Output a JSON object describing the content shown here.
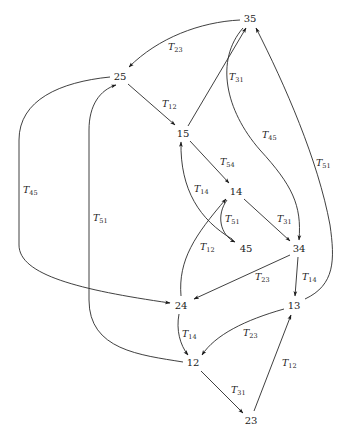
{
  "diagram": {
    "type": "directed-graph",
    "nodes": [
      {
        "id": "35",
        "label": "35",
        "x": 250,
        "y": 19
      },
      {
        "id": "25",
        "label": "25",
        "x": 120,
        "y": 77
      },
      {
        "id": "15",
        "label": "15",
        "x": 183,
        "y": 134
      },
      {
        "id": "14",
        "label": "14",
        "x": 236,
        "y": 192
      },
      {
        "id": "45",
        "label": "45",
        "x": 246,
        "y": 249
      },
      {
        "id": "34",
        "label": "34",
        "x": 299,
        "y": 249
      },
      {
        "id": "24",
        "label": "24",
        "x": 181,
        "y": 306
      },
      {
        "id": "13",
        "label": "13",
        "x": 294,
        "y": 306
      },
      {
        "id": "12",
        "label": "12",
        "x": 193,
        "y": 363
      },
      {
        "id": "23",
        "label": "23",
        "x": 251,
        "y": 421
      }
    ],
    "edges": [
      {
        "from": "35",
        "to": "25",
        "label": "T",
        "sub": "23",
        "lx": 168,
        "ly": 50
      },
      {
        "from": "25",
        "to": "15",
        "label": "T",
        "sub": "12",
        "lx": 162,
        "ly": 107
      },
      {
        "from": "15",
        "to": "35",
        "label": "T",
        "sub": "31",
        "lx": 229,
        "ly": 80
      },
      {
        "from": "35",
        "to": "34",
        "label": "T",
        "sub": "45",
        "lx": 262,
        "ly": 138
      },
      {
        "from": "13",
        "to": "35",
        "label": "T",
        "sub": "51",
        "lx": 316,
        "ly": 166
      },
      {
        "from": "15",
        "to": "14",
        "label": "T",
        "sub": "54",
        "lx": 220,
        "ly": 165
      },
      {
        "from": "45",
        "to": "15",
        "label": "T",
        "sub": "14",
        "lx": 194,
        "ly": 192
      },
      {
        "from": "14",
        "to": "45",
        "label": "T",
        "sub": "51",
        "lx": 225,
        "ly": 222
      },
      {
        "from": "24",
        "to": "14",
        "label": "T",
        "sub": "12",
        "lx": 200,
        "ly": 250
      },
      {
        "from": "14",
        "to": "34",
        "label": "T",
        "sub": "31",
        "lx": 277,
        "ly": 222
      },
      {
        "from": "34",
        "to": "24",
        "label": "T",
        "sub": "23",
        "lx": 255,
        "ly": 280
      },
      {
        "from": "34",
        "to": "13",
        "label": "T",
        "sub": "14",
        "lx": 302,
        "ly": 280
      },
      {
        "from": "25",
        "to": "24",
        "label": "T",
        "sub": "45",
        "lx": 23,
        "ly": 193
      },
      {
        "from": "12",
        "to": "25",
        "label": "T",
        "sub": "51",
        "lx": 93,
        "ly": 221
      },
      {
        "from": "24",
        "to": "12",
        "label": "T",
        "sub": "14",
        "lx": 182,
        "ly": 337
      },
      {
        "from": "13",
        "to": "12",
        "label": "T",
        "sub": "23",
        "lx": 243,
        "ly": 336
      },
      {
        "from": "12",
        "to": "23",
        "label": "T",
        "sub": "31",
        "lx": 231,
        "ly": 393
      },
      {
        "from": "23",
        "to": "13",
        "label": "T",
        "sub": "12",
        "lx": 282,
        "ly": 366
      }
    ]
  }
}
